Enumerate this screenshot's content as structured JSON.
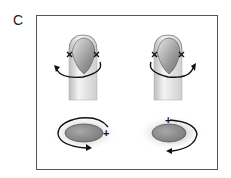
{
  "panel": {
    "label": "C"
  },
  "figures": [
    {
      "id": "left-tooth",
      "markers": [
        "x",
        "x"
      ],
      "rotation": "counterclockwise-up-left"
    },
    {
      "id": "right-tooth",
      "markers": [
        "x",
        "x"
      ],
      "rotation": "clockwise-up-right"
    },
    {
      "id": "left-disc",
      "sign": "+",
      "rotation": "clockwise"
    },
    {
      "id": "right-disc",
      "sign": "+",
      "rotation": "counterclockwise"
    }
  ],
  "colors": {
    "frame": "#555555",
    "stroke": "#222222",
    "disc_fill": "#8a8a8a",
    "shade": "#cfcfcf"
  }
}
